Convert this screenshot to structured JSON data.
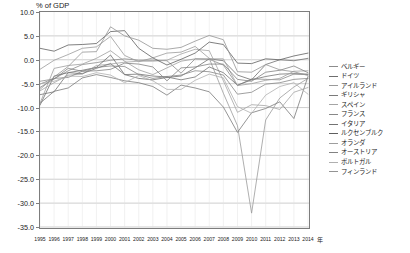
{
  "chart_data": {
    "type": "line",
    "title": "% of GDP",
    "xlabel": "年",
    "ylabel": "% of GDP",
    "ylim": [
      -35,
      10
    ],
    "yticks": [
      "10.0",
      "5.0",
      "0.0",
      "-5.0",
      "-10.0",
      "-15.0",
      "-20.0",
      "-25.0",
      "-30.0",
      "-35.0"
    ],
    "ytick_values": [
      10,
      5,
      0,
      -5,
      -10,
      -15,
      -20,
      -25,
      -30,
      -35
    ],
    "grid": true,
    "legend_position": "right",
    "x": [
      1995,
      1996,
      1997,
      1998,
      1999,
      2000,
      2001,
      2002,
      2003,
      2004,
      2005,
      2006,
      2007,
      2008,
      2009,
      2010,
      2011,
      2012,
      2013,
      2014
    ],
    "categories": [
      "1995",
      "1996",
      "1997",
      "1998",
      "1999",
      "2000",
      "2001",
      "2002",
      "2003",
      "2004",
      "2005",
      "2006",
      "2007",
      "2008",
      "2009",
      "2010",
      "2011",
      "2012",
      "2013",
      "2014"
    ],
    "series": [
      {
        "name": "ベルギー",
        "color": "#8c8c8c",
        "values": [
          -4.5,
          -4.0,
          -2.3,
          -1.0,
          -0.6,
          -0.1,
          0.2,
          -0.1,
          -0.1,
          -0.2,
          -2.8,
          0.2,
          0.1,
          -1.1,
          -5.4,
          -4.0,
          -4.1,
          -4.2,
          -3.0,
          -3.1
        ]
      },
      {
        "name": "ドイツ",
        "color": "#6e6e6e",
        "values": [
          -9.5,
          -3.4,
          -2.7,
          -2.2,
          -1.6,
          1.0,
          -3.1,
          -3.9,
          -4.2,
          -3.7,
          -3.4,
          -1.7,
          0.2,
          -0.2,
          -3.2,
          -4.2,
          -1.0,
          0.0,
          -0.2,
          0.3
        ]
      },
      {
        "name": "アイルランド",
        "color": "#9a9a9a",
        "values": [
          -2.0,
          -0.1,
          1.1,
          2.4,
          2.7,
          4.9,
          0.9,
          -0.4,
          0.4,
          1.4,
          1.6,
          2.8,
          0.3,
          -7.0,
          -13.8,
          -32.1,
          -12.6,
          -8.0,
          -5.7,
          -3.9
        ]
      },
      {
        "name": "ギリシャ",
        "color": "#7a7a7a",
        "values": [
          -9.1,
          -6.6,
          -5.9,
          -3.8,
          -3.1,
          -3.7,
          -4.4,
          -4.8,
          -5.6,
          -7.4,
          -5.3,
          -5.9,
          -6.7,
          -9.9,
          -15.2,
          -11.1,
          -10.2,
          -8.8,
          -12.3,
          -3.5
        ]
      },
      {
        "name": "スペイン",
        "color": "#a5a5a5",
        "values": [
          -6.5,
          -4.8,
          -3.2,
          -3.0,
          -1.2,
          -0.9,
          -0.5,
          -0.3,
          -0.3,
          -0.1,
          1.2,
          2.2,
          1.9,
          -4.4,
          -11.0,
          -9.4,
          -9.6,
          -10.4,
          -6.8,
          -5.8
        ]
      },
      {
        "name": "フランス",
        "color": "#888888",
        "values": [
          -5.1,
          -3.9,
          -3.7,
          -2.4,
          -1.6,
          -1.3,
          -1.4,
          -3.1,
          -3.9,
          -3.5,
          -3.2,
          -2.3,
          -2.5,
          -3.2,
          -7.2,
          -6.8,
          -5.1,
          -4.8,
          -4.1,
          -3.9
        ]
      },
      {
        "name": "イタリア",
        "color": "#737373",
        "values": [
          -7.3,
          -6.7,
          -2.7,
          -2.9,
          -1.8,
          -0.8,
          -3.1,
          -3.0,
          -3.4,
          -3.6,
          -4.2,
          -3.6,
          -1.5,
          -2.7,
          -5.3,
          -4.2,
          -3.5,
          -3.0,
          -2.9,
          -3.0
        ]
      },
      {
        "name": "ルクセンブルク",
        "color": "#5f5f5f",
        "values": [
          2.4,
          1.8,
          3.1,
          3.2,
          3.4,
          5.9,
          6.1,
          2.4,
          0.4,
          -1.1,
          0.1,
          1.4,
          3.7,
          3.2,
          -0.7,
          -0.8,
          0.2,
          0.0,
          0.8,
          1.4
        ]
      },
      {
        "name": "オランダ",
        "color": "#9e9e9e",
        "values": [
          -9.1,
          -1.8,
          -1.2,
          -0.9,
          0.3,
          1.9,
          -0.3,
          -2.1,
          -3.1,
          -1.7,
          -0.3,
          0.2,
          0.2,
          0.2,
          -5.4,
          -5.0,
          -4.3,
          -3.9,
          -2.4,
          -2.3
        ]
      },
      {
        "name": "オーストリア",
        "color": "#828282",
        "values": [
          -5.8,
          -4.0,
          -1.8,
          -2.4,
          -2.3,
          -2.0,
          -0.7,
          -0.9,
          -1.5,
          -4.4,
          -1.7,
          -1.5,
          -0.9,
          -0.9,
          -4.1,
          -4.5,
          -2.6,
          -2.2,
          -1.3,
          -2.7
        ]
      },
      {
        "name": "ポルトガル",
        "color": "#b0b0b0",
        "values": [
          -5.0,
          -4.5,
          -3.4,
          -3.5,
          -2.7,
          -3.2,
          -4.8,
          -3.3,
          -4.4,
          -6.2,
          -6.2,
          -4.3,
          -3.0,
          -3.8,
          -9.8,
          -11.2,
          -7.4,
          -5.6,
          -4.8,
          -7.2
        ]
      },
      {
        "name": "フィンランド",
        "color": "#949494",
        "values": [
          -6.2,
          -3.6,
          -1.4,
          1.6,
          1.7,
          6.9,
          5.0,
          4.1,
          2.4,
          2.2,
          2.6,
          3.9,
          5.1,
          4.2,
          -2.5,
          -2.6,
          -1.0,
          -2.1,
          -2.5,
          -3.3
        ]
      }
    ]
  }
}
